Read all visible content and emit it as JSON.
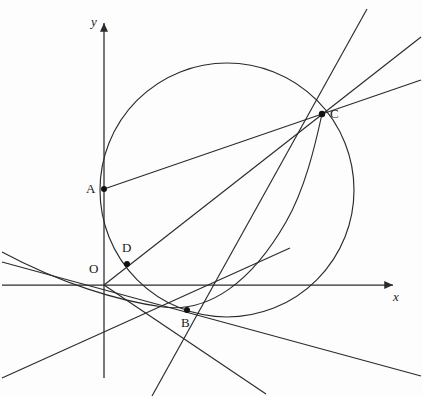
{
  "figure": {
    "type": "geometry-diagram",
    "title": "",
    "background": "#fdfdfd",
    "stroke_color": "#2b2b2b",
    "point_color": "#111111",
    "width": 423,
    "height": 396
  },
  "axes": {
    "x_label": "x",
    "y_label": "y",
    "origin_label": "O",
    "x_axis": {
      "y": 285,
      "x_start": 2,
      "x_end": 397
    },
    "y_axis": {
      "x": 104,
      "y_start": 18,
      "y_end": 378
    }
  },
  "points": [
    {
      "id": "O",
      "label": "O",
      "x": 104,
      "y": 285,
      "label_dx": -14,
      "label_dy": -18,
      "dot": false
    },
    {
      "id": "A",
      "label": "A",
      "x": 104,
      "y": 189,
      "label_dx": -16,
      "label_dy": -7,
      "dot": true
    },
    {
      "id": "B",
      "label": "B",
      "x": 187,
      "y": 310,
      "label_dx": -5,
      "label_dy": 8,
      "dot": true
    },
    {
      "id": "C",
      "label": "C",
      "x": 322,
      "y": 114,
      "label_dx": 7,
      "label_dy": -6,
      "dot": true
    },
    {
      "id": "D",
      "label": "D",
      "x": 127,
      "y": 264,
      "label_dx": -3,
      "label_dy": -22,
      "dot": true
    }
  ],
  "circle": {
    "id": "circumcircle-ABC",
    "cx": 227,
    "cy": 190,
    "r": 127
  },
  "curves": [
    {
      "id": "parabola-OBC",
      "kind": "parabola",
      "path": "M 2 253 Q 100 297 160 307 Q 230 318 322 114"
    }
  ],
  "segments": [
    {
      "id": "AC",
      "from": "A",
      "to": "C",
      "x1": 104,
      "y1": 189,
      "x2": 322,
      "y2": 114
    },
    {
      "id": "OC",
      "from": "O",
      "to": "C",
      "x1": 104,
      "y1": 285,
      "x2": 322,
      "y2": 114
    },
    {
      "id": "BC",
      "from": "B",
      "to": "C",
      "x1": 187,
      "y1": 310,
      "x2": 322,
      "y2": 114
    }
  ],
  "lines": [
    {
      "id": "line-OC-extended",
      "x1": 104,
      "y1": 285,
      "x2": 421,
      "y2": 37
    },
    {
      "id": "line-AC-extended",
      "x1": 104,
      "y1": 189,
      "x2": 421,
      "y2": 80
    },
    {
      "id": "line-BC-extended",
      "x1": 104,
      "y1": 396,
      "x2": 370,
      "y2": 10
    },
    {
      "id": "line-OB-extended",
      "x1": 2,
      "y1": 262,
      "x2": 421,
      "y2": 376
    },
    {
      "id": "line-through-O-downleft",
      "x1": 2,
      "y1": 378,
      "x2": 260,
      "y2": 262
    },
    {
      "id": "line-B-tangent-down",
      "x1": 104,
      "y1": 285,
      "x2": 264,
      "y2": 392
    }
  ],
  "chart_data": {
    "type": "scatter",
    "title": "",
    "xlabel": "x",
    "ylabel": "y",
    "annotations": [
      "O",
      "A",
      "B",
      "C",
      "D"
    ]
  }
}
